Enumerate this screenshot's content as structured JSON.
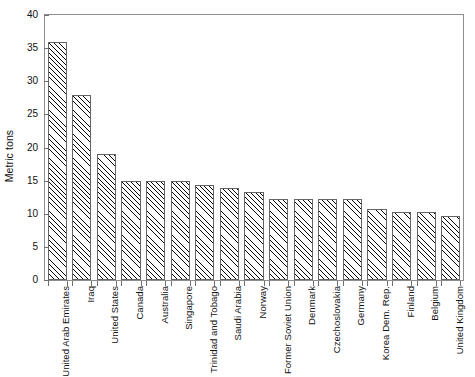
{
  "chart_data": {
    "type": "bar",
    "title": "",
    "subtitle": "",
    "xlabel": "",
    "ylabel": "Metric tons",
    "ylim": [
      0,
      40
    ],
    "yticks": [
      0,
      5,
      10,
      15,
      20,
      25,
      30,
      35,
      40
    ],
    "ytick_labels": [
      "0",
      "5",
      "10",
      "15",
      "20",
      "25",
      "30",
      "35",
      "40"
    ],
    "grid": false,
    "legend": null,
    "bar_style": {
      "fill": "diagonal-hatch",
      "edge_color": "#5f5f5f",
      "face_color": "#ffffff"
    },
    "categories": [
      "United Arab Emirates",
      "Iraq",
      "United States",
      "Canada",
      "Australia",
      "Singapore",
      "Trinidad and Tobago",
      "Saudi Arabia",
      "Norway",
      "Former Soviet Union",
      "Denmark",
      "Czechoslovakia",
      "Germany",
      "Korea Dem. Rep.",
      "Finland",
      "Belgium",
      "United Kingdom"
    ],
    "values": [
      36.0,
      28.0,
      19.0,
      15.0,
      15.0,
      15.0,
      14.4,
      13.9,
      13.3,
      12.3,
      12.3,
      12.3,
      12.2,
      10.7,
      10.2,
      10.2,
      9.6
    ]
  }
}
